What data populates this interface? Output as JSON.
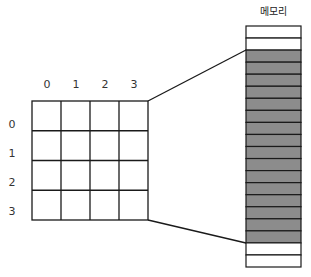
{
  "diagram": {
    "memory_label": "메모리",
    "column_labels": [
      "0",
      "1",
      "2",
      "3"
    ],
    "row_labels": [
      "0",
      "1",
      "2",
      "3"
    ],
    "grid": {
      "rows": 4,
      "cols": 4
    },
    "memory": {
      "cells": [
        "empty",
        "empty",
        "filled",
        "filled",
        "filled",
        "filled",
        "filled",
        "filled",
        "filled",
        "filled",
        "filled",
        "filled",
        "filled",
        "filled",
        "filled",
        "filled",
        "filled",
        "filled",
        "empty",
        "empty"
      ]
    },
    "colors": {
      "filled": "#8c8c8c",
      "empty": "#ffffff",
      "line": "#1a1a1a"
    }
  }
}
